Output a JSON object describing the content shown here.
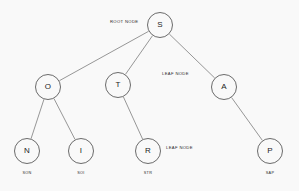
{
  "diagram": {
    "background_color": "#f9f9f9",
    "stroke_color": "#6b6b6b",
    "text_color": "#1d1d1d",
    "nodes": [
      {
        "id": "S",
        "label": "S",
        "cx": 160,
        "cy": 25,
        "r": 13
      },
      {
        "id": "O",
        "label": "O",
        "cx": 48,
        "cy": 87,
        "r": 13
      },
      {
        "id": "T",
        "label": "T",
        "cx": 118,
        "cy": 85,
        "r": 13
      },
      {
        "id": "A",
        "label": "A",
        "cx": 224,
        "cy": 87,
        "r": 13
      },
      {
        "id": "N",
        "label": "N",
        "cx": 27,
        "cy": 151,
        "r": 13
      },
      {
        "id": "I",
        "label": "I",
        "cx": 81,
        "cy": 151,
        "r": 13
      },
      {
        "id": "R",
        "label": "R",
        "cx": 148,
        "cy": 151,
        "r": 13
      },
      {
        "id": "P",
        "label": "P",
        "cx": 270,
        "cy": 151,
        "r": 13
      }
    ],
    "edges": [
      {
        "from": "S",
        "to": "O"
      },
      {
        "from": "S",
        "to": "T"
      },
      {
        "from": "S",
        "to": "A"
      },
      {
        "from": "O",
        "to": "N"
      },
      {
        "from": "O",
        "to": "I"
      },
      {
        "from": "T",
        "to": "R"
      },
      {
        "from": "A",
        "to": "P"
      }
    ],
    "annotations": [
      {
        "id": "root-node",
        "text": "ROOT NODE",
        "x": 110,
        "y": 20
      },
      {
        "id": "leaf-node-a",
        "text": "LEAF NODE",
        "x": 162,
        "y": 72
      },
      {
        "id": "leaf-node-r",
        "text": "LEAF NODE",
        "x": 166,
        "y": 146
      }
    ],
    "word_labels": [
      {
        "id": "word-son",
        "text": "SON",
        "cx": 27,
        "y": 172
      },
      {
        "id": "word-soi",
        "text": "SOI",
        "cx": 81,
        "y": 172
      },
      {
        "id": "word-str",
        "text": "STR",
        "cx": 148,
        "y": 172
      },
      {
        "id": "word-sap",
        "text": "SAP",
        "cx": 270,
        "y": 172
      }
    ]
  }
}
